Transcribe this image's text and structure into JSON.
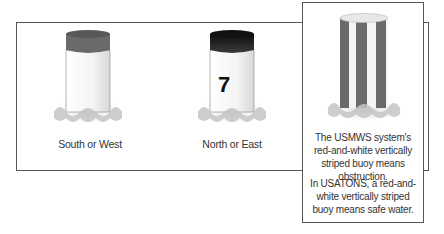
{
  "buoys": [
    {
      "name": "south-west-buoy",
      "caption": "South or West",
      "top_color": "#6a6a6a",
      "numeral": ""
    },
    {
      "name": "north-east-buoy",
      "caption": "North or East",
      "top_color": "#1e1e1e",
      "numeral": "7"
    },
    {
      "name": "striped-buoy",
      "caption": "",
      "stripe_color": "#6a6a6a",
      "numeral": ""
    }
  ],
  "inset": {
    "paragraph1": "The USMWS system's red-and-white vertically striped buoy means obstruction.",
    "paragraph2": "In USATONS, a red-and-white vertically striped buoy means safe water."
  }
}
